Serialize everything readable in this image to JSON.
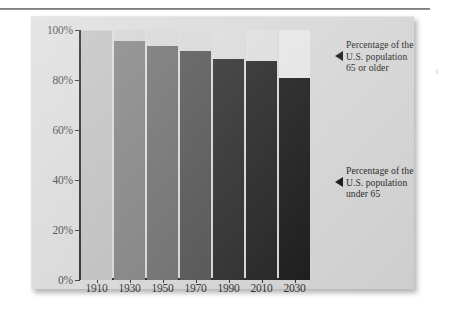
{
  "chart_data": {
    "type": "bar",
    "title": "",
    "subtitle": "",
    "xlabel": "",
    "ylabel": "",
    "ylim": [
      0,
      100
    ],
    "grid": false,
    "legend_position": "right-annotations",
    "stacked": true,
    "categories": [
      "1910",
      "1930",
      "1950",
      "1970",
      "1990",
      "2010",
      "2030"
    ],
    "y_ticks": [
      "0%",
      "20%",
      "40%",
      "60%",
      "80%",
      "100%"
    ],
    "y_tick_values": [
      0,
      20,
      40,
      60,
      80,
      100
    ],
    "series": [
      {
        "name": "Percentage of the U.S. population under 65",
        "values": [
          99.5,
          95.8,
          93.5,
          91.8,
          88.4,
          87.8,
          81.0
        ]
      },
      {
        "name": "Percentage of the U.S. population 65 or older",
        "values": [
          0.5,
          4.2,
          6.5,
          8.2,
          11.6,
          12.2,
          19.0
        ]
      }
    ],
    "bar_colors_under_65": [
      "#c0c0c0",
      "#7e7e7e",
      "#6a6a6a",
      "#4e4e4e",
      "#262626",
      "#1e1e1e",
      "#151515"
    ],
    "bar_colors_65_or_older": [
      "#cfcfcf",
      "#d4d4d4",
      "#d8d8d8",
      "#dadada",
      "#dedede",
      "#e2e2e2",
      "#ececec"
    ],
    "annotations": [
      {
        "id": "older",
        "text": "Percentage of the\nU.S. population\n65 or older",
        "marker": "left-triangle"
      },
      {
        "id": "under",
        "text": "Percentage of the\nU.S. population\nunder 65",
        "marker": "left-triangle"
      }
    ]
  },
  "figure": {
    "panel_background": "#dcdcdc",
    "axis_color": "#1c1c1c"
  },
  "edge_artifact": "t"
}
